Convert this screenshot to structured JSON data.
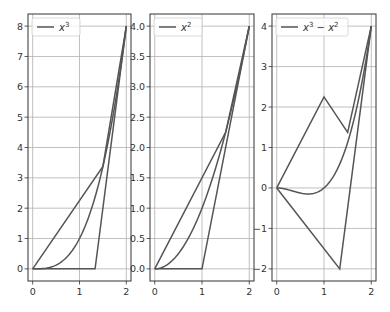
{
  "chart_data": [
    {
      "type": "line",
      "title": "",
      "legend": [
        "x^3"
      ],
      "legend_label": "x",
      "legend_sup": "3",
      "xlim": [
        -0.1,
        2.1
      ],
      "ylim": [
        -0.4,
        8.4
      ],
      "xticks": [
        "0",
        "1",
        "2"
      ],
      "yticks": [
        "0",
        "1",
        "2",
        "3",
        "4",
        "5",
        "6",
        "7",
        "8"
      ],
      "grid": true,
      "series": [
        {
          "name": "x^3",
          "x": [
            0,
            0.25,
            0.5,
            0.75,
            1.0,
            1.25,
            1.5,
            1.75,
            2.0
          ],
          "y": [
            0,
            0.0156,
            0.125,
            0.422,
            1.0,
            1.953,
            3.375,
            5.359,
            8.0
          ]
        },
        {
          "name": "upper-polyline",
          "x": [
            0,
            1.5,
            2.0
          ],
          "y": [
            0,
            3.375,
            8.0
          ]
        },
        {
          "name": "lower-polyline",
          "x": [
            0,
            1.333,
            2.0
          ],
          "y": [
            0,
            0,
            8.0
          ]
        }
      ]
    },
    {
      "type": "line",
      "title": "",
      "legend": [
        "x^2"
      ],
      "legend_label": "x",
      "legend_sup": "2",
      "xlim": [
        -0.1,
        2.1
      ],
      "ylim": [
        -0.2,
        4.2
      ],
      "xticks": [
        "0",
        "1",
        "2"
      ],
      "yticks": [
        "0.0",
        "0.5",
        "1.0",
        "1.5",
        "2.0",
        "2.5",
        "3.0",
        "3.5",
        "4.0"
      ],
      "grid": true,
      "series": [
        {
          "name": "x^2",
          "x": [
            0,
            0.25,
            0.5,
            0.75,
            1.0,
            1.25,
            1.5,
            1.75,
            2.0
          ],
          "y": [
            0,
            0.0625,
            0.25,
            0.5625,
            1.0,
            1.5625,
            2.25,
            3.0625,
            4.0
          ]
        },
        {
          "name": "upper-polyline",
          "x": [
            0,
            1.5,
            2.0
          ],
          "y": [
            0,
            2.25,
            4.0
          ]
        },
        {
          "name": "lower-polyline",
          "x": [
            0,
            1.0,
            2.0
          ],
          "y": [
            0,
            0,
            4.0
          ]
        }
      ]
    },
    {
      "type": "line",
      "title": "",
      "legend": [
        "x^3 - x^2"
      ],
      "legend_label": "x",
      "legend_sup": "3",
      "legend_mid": " − x",
      "legend_sup2": "2",
      "xlim": [
        -0.1,
        2.1
      ],
      "ylim": [
        -2.3,
        4.3
      ],
      "xticks": [
        "0",
        "1",
        "2"
      ],
      "yticks": [
        "−2",
        "−1",
        "0",
        "1",
        "2",
        "3",
        "4"
      ],
      "grid": true,
      "series": [
        {
          "name": "x^3 - x^2",
          "x": [
            0,
            0.25,
            0.5,
            0.667,
            0.75,
            1.0,
            1.25,
            1.5,
            1.75,
            2.0
          ],
          "y": [
            0,
            -0.047,
            -0.125,
            -0.148,
            -0.141,
            0,
            0.391,
            1.125,
            2.297,
            4.0
          ]
        },
        {
          "name": "upper-polyline",
          "x": [
            0,
            1.0,
            1.5,
            2.0
          ],
          "y": [
            0,
            2.25,
            1.375,
            4.0
          ]
        },
        {
          "name": "lower-polyline",
          "x": [
            0,
            1.333,
            2.0
          ],
          "y": [
            0,
            -2.0,
            4.0
          ]
        }
      ]
    }
  ],
  "style": {
    "line_color": "#555555",
    "grid_color": "#b0b0b0",
    "axis_color": "#333333"
  }
}
